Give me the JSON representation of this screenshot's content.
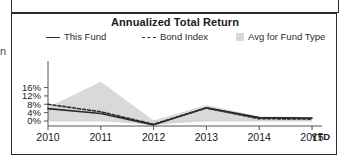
{
  "panel": {
    "edge_glyph": "n"
  },
  "chart": {
    "title": "Annualized Total Return",
    "legend": [
      {
        "label": "This Fund",
        "marker": "solid-line-swatch"
      },
      {
        "label": "Bond Index",
        "marker": "dashed-line-swatch"
      },
      {
        "label": "Avg for Fund Type",
        "marker": "area-swatch"
      }
    ],
    "ytd_label": "YTD",
    "colors": {
      "line": "#2b2b2b",
      "area": "#d9d9d9",
      "axis": "#555555",
      "frame": "#2b2b2b",
      "text": "#1a1a1a"
    }
  },
  "chart_data": {
    "type": "line",
    "title": "Annualized Total Return",
    "xlabel": "",
    "ylabel": "",
    "grid": false,
    "legend_position": "top",
    "x": [
      "2010",
      "2011",
      "2012",
      "2013",
      "2014",
      "2015"
    ],
    "x_tick_labels": [
      "2010",
      "2011",
      "2012",
      "2013",
      "2014",
      "2015"
    ],
    "x_suffix_label": "YTD",
    "y_tick_labels": [
      "0%",
      "4%",
      "8%",
      "12%",
      "16%"
    ],
    "y_ticks": [
      0,
      4,
      8,
      12,
      16
    ],
    "ylim": [
      -3,
      19
    ],
    "series": [
      {
        "name": "This Fund",
        "style": "solid",
        "values": [
          5.9,
          3.6,
          -1.8,
          6.3,
          1.6,
          1.4
        ]
      },
      {
        "name": "Bond Index",
        "style": "dashed",
        "values": [
          8.0,
          4.4,
          -1.6,
          6.2,
          1.1,
          0.9
        ]
      },
      {
        "name": "Avg for Fund Type",
        "style": "area",
        "upper": [
          6.6,
          18.8,
          0.2,
          7.7,
          2.2,
          1.9
        ],
        "lower": [
          0.0,
          0.0,
          -1.9,
          0.0,
          0.0,
          0.0
        ]
      }
    ]
  }
}
